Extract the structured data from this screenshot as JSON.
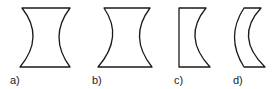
{
  "diagram": {
    "figures": [
      {
        "id": "a",
        "label": "a)",
        "shape": "biconcave, symmetric"
      },
      {
        "id": "b",
        "label": "b)",
        "shape": "biconcave, shallow curvature"
      },
      {
        "id": "c",
        "label": "c)",
        "shape": "plano-concave"
      },
      {
        "id": "d",
        "label": "d)",
        "shape": "concave meniscus"
      }
    ],
    "colors": {
      "stroke": "#1a1a1a",
      "background": "#ffffff"
    }
  }
}
